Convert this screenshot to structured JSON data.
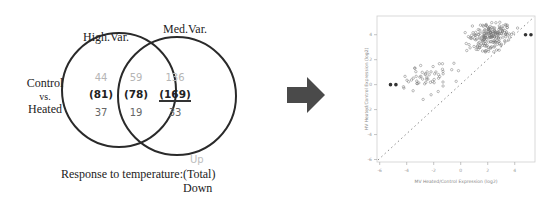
{
  "venn": {
    "sets": [
      {
        "name": "High.Var.",
        "label": "High.Var."
      },
      {
        "name": "Med.Var.",
        "label": "Med.Var."
      }
    ],
    "side_label": [
      "Control",
      "vs.",
      "Heated"
    ],
    "regions": {
      "high_only": {
        "up": "44",
        "total": "(81)",
        "down": "37"
      },
      "overlap": {
        "up": "59",
        "total": "(78)",
        "down": "19"
      },
      "med_only": {
        "up": "136",
        "total": "(169)",
        "down": "33"
      }
    },
    "legend": {
      "up": "Up",
      "total": "Response to temperature:(Total)",
      "down": "Down"
    }
  },
  "arrow": {
    "icon": "right-arrow-icon",
    "color": "#4a4a4a"
  },
  "chart_data": {
    "type": "scatter",
    "title": "",
    "xlabel": "MV Heated/Control Expression (log2)",
    "ylabel": "HV Heated/Control Expression (log2)",
    "xlim": [
      -6.2,
      5.5
    ],
    "ylim": [
      -6.2,
      5.5
    ],
    "xticks": [
      "-6",
      "-4",
      "-2",
      "0",
      "2",
      "4"
    ],
    "yticks": [
      "-6",
      "-4",
      "-2",
      "0",
      "2",
      "4"
    ],
    "grid": false,
    "reference_line": {
      "type": "y=x",
      "style": "dotted"
    },
    "highlighted_points": [
      {
        "x": -5.2,
        "y": 0.0
      },
      {
        "x": -4.8,
        "y": 0.0
      },
      {
        "x": 4.8,
        "y": 4.0
      },
      {
        "x": 5.2,
        "y": 4.0
      }
    ],
    "clusters": [
      {
        "name": "down-regulated",
        "center_x": -2.5,
        "center_y": 0.5,
        "spread": 1.0,
        "approx_n": 55
      },
      {
        "name": "up-regulated",
        "center_x": 2.2,
        "center_y": 3.8,
        "spread": 0.9,
        "approx_n": 200
      }
    ]
  }
}
